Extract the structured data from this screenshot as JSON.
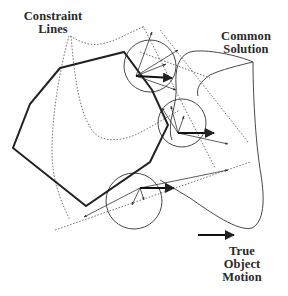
{
  "labels": {
    "constraint_lines": [
      "Constraint",
      "Lines"
    ],
    "common_solution": [
      "Common",
      "Solution"
    ],
    "true_object_motion": [
      "True",
      "Object",
      "Motion"
    ]
  },
  "diagram": {
    "object_outline": {
      "description": "thick polygon outline of moving object",
      "vertices": [
        [
          60,
          68
        ],
        [
          124,
          52
        ],
        [
          152,
          90
        ],
        [
          168,
          125
        ],
        [
          150,
          162
        ],
        [
          86,
          206
        ],
        [
          13,
          148
        ],
        [
          30,
          104
        ]
      ],
      "color": "#222222"
    },
    "aperture_circles": [
      {
        "cx": 150,
        "cy": 66,
        "r": 26
      },
      {
        "cx": 182,
        "cy": 123,
        "r": 24
      },
      {
        "cx": 134,
        "cy": 201,
        "r": 28
      }
    ],
    "true_motion_arrow": {
      "x1": 212,
      "y1": 235,
      "x2": 234,
      "y2": 235
    }
  },
  "colors": {
    "ink": "#222222",
    "dotted": "#6a6a6a",
    "background": "#ffffff"
  }
}
